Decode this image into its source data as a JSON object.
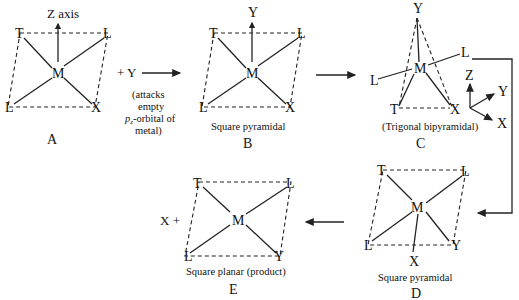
{
  "diagram": {
    "structures": {
      "A": {
        "letter": "A",
        "center": "M",
        "ligands": [
          "T",
          "L",
          "L",
          "X"
        ],
        "axis_label": "Z axis",
        "caption": ""
      },
      "B": {
        "letter": "B",
        "center": "M",
        "ligands": [
          "T",
          "L",
          "L",
          "X"
        ],
        "apical": "Y",
        "caption": "Square pyramidal"
      },
      "C": {
        "letter": "C",
        "center": "M",
        "ligands": [
          "Y",
          "L",
          "L",
          "T",
          "X"
        ],
        "caption": "(Trigonal bipyramidal)",
        "axes": {
          "z": "Z",
          "y": "Y",
          "x": "X"
        }
      },
      "D": {
        "letter": "D",
        "center": "M",
        "ligands": [
          "T",
          "L",
          "L",
          "Y"
        ],
        "apical": "X",
        "caption": "Square pyramidal"
      },
      "E": {
        "letter": "E",
        "center": "M",
        "ligands": [
          "T",
          "L",
          "L",
          "Y"
        ],
        "caption": "Square planar (product)",
        "leaving": "X +"
      }
    },
    "reagent": {
      "label": "+ Y",
      "note_lines": [
        "(attacks",
        "empty",
        "p",
        "z",
        "-orbital of",
        "metal)"
      ]
    }
  }
}
